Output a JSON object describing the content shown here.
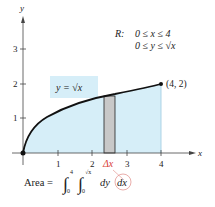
{
  "axes": {
    "x_label": "x",
    "y_label": "y",
    "x_ticks": [
      "1",
      "2",
      "3",
      "4"
    ],
    "y_ticks": [
      "1",
      "2",
      "3"
    ]
  },
  "curve_label": "y = √x",
  "point_label": "(4, 2)",
  "region": {
    "name": "R:",
    "line1": "0 ≤ x ≤ 4",
    "line2": "0 ≤ y ≤ √x"
  },
  "delta_label": "Δx",
  "area": {
    "prefix": "Area =",
    "upper_outer": "4",
    "lower_outer": "0",
    "upper_inner": "√x",
    "lower_inner": "0",
    "dy": "dy",
    "dx": "dx"
  },
  "colors": {
    "fill": "#d6eef8",
    "rect": "#c8c8c8",
    "accent": "#d9413a"
  }
}
